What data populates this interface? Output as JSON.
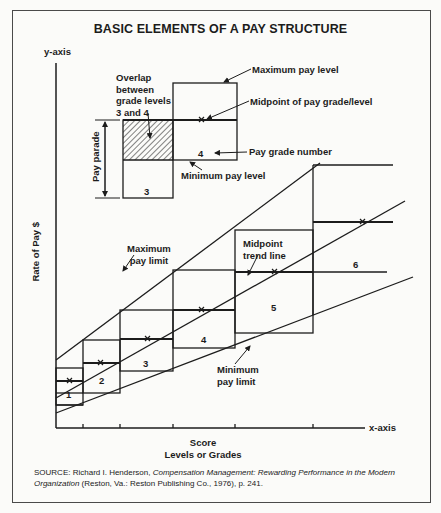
{
  "title": "BASIC ELEMENTS OF A PAY STRUCTURE",
  "axes": {
    "y_axis_label": "y-axis",
    "x_axis_label": "x-axis",
    "y_title": "Rate of Pay $",
    "x_title_line1": "Score",
    "x_title_line2": "Levels or Grades"
  },
  "inset": {
    "overlap_label": [
      "Overlap",
      "between",
      "grade levels",
      "3 and 4"
    ],
    "pay_range_label": "Pay parade",
    "max_pay_level": "Maximum pay level",
    "midpoint_label": "Midpoint of pay grade/level",
    "pay_grade_number_label": "Pay grade number",
    "min_pay_level": "Minimum pay level",
    "grade_lower": "3",
    "grade_upper": "4"
  },
  "annotations": {
    "max_pay_limit": [
      "Maximum",
      "pay limit"
    ],
    "midpoint_trend_line": [
      "Midpoint",
      "trend line"
    ],
    "min_pay_limit": [
      "Minimum",
      "pay limit"
    ]
  },
  "grades": [
    {
      "label": "1"
    },
    {
      "label": "2"
    },
    {
      "label": "3"
    },
    {
      "label": "4"
    },
    {
      "label": "5"
    },
    {
      "label": "6"
    }
  ],
  "source": {
    "prefix": "SOURCE: Richard I. Henderson, ",
    "book": "Compensation Management: Rewarding Performance in the Modern Organization",
    "suffix": " (Reston, Va.: Reston Publishing Co., 1976), p. 241."
  },
  "colors": {
    "ink": "#1c1c1c",
    "paper": "#fbfbf9",
    "frame": "#4a4a4a"
  }
}
